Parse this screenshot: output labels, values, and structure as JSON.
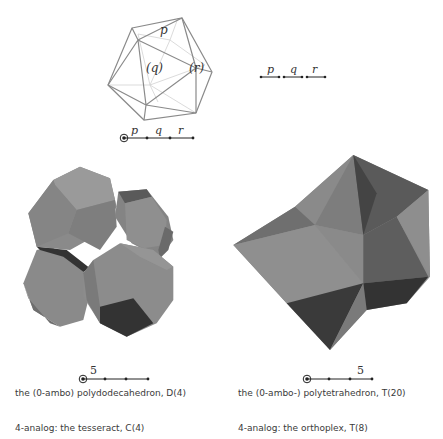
{
  "icosahedron": {
    "label_vertex": "p",
    "label_face": "(q)",
    "label_edge": "(r)"
  },
  "coxeter_top_left": {
    "ringed_node": 0,
    "branch_labels": [
      "p",
      "q",
      "r"
    ]
  },
  "coxeter_top_right": {
    "branch_labels": [
      "p",
      "q",
      "r"
    ]
  },
  "left_figure": {
    "coxeter_label": "5",
    "coxeter_label_position": "first-branch",
    "name": "the (0-ambo) polydodecahedron, D(4)",
    "analog": "4-analog: the tesseract, C(4)"
  },
  "right_figure": {
    "coxeter_label": "5",
    "coxeter_label_position": "last-branch",
    "name": "the (0-ambo-) polytetrahedron, T(20)",
    "analog": "4-analog: the orthoplex, T(8)"
  },
  "colors": {
    "wire": "#8a8a8a",
    "wire_light": "#cfcfcf",
    "face_light": "#8f8f8f",
    "face_mid": "#7a7a7a",
    "face_dark": "#3e3e3e"
  }
}
